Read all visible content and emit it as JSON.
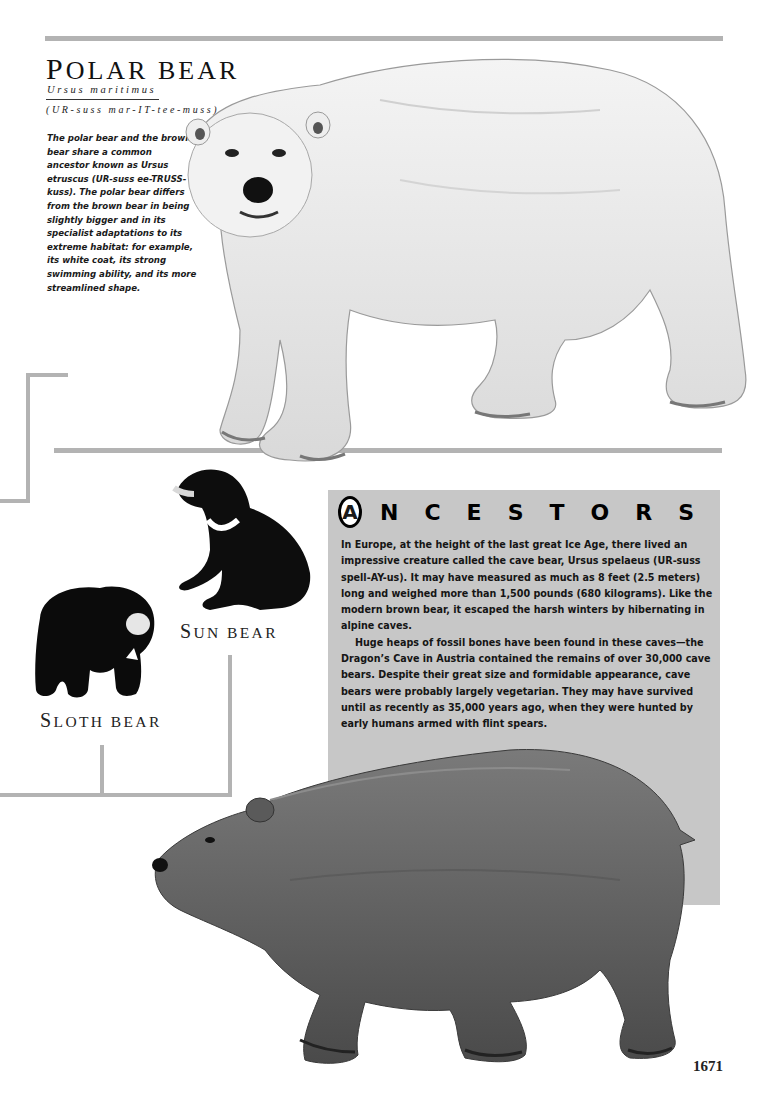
{
  "page": {
    "number": "1671",
    "colors": {
      "rule": "#b3b3b3",
      "ancestors_bg": "#c7c7c7",
      "text": "#1a1a1a"
    }
  },
  "polar_bear": {
    "title_cap": "P",
    "title_rest": "OLAR BEAR",
    "latin_name": "Ursus maritimus",
    "pronunciation": "(UR-suss mar-IT-tee-muss)",
    "intro": "The polar bear and the brown bear share a common ancestor known as Ursus etruscus (UR-suss ee-TRUSS-kuss). The polar bear differs from the brown bear in being slightly bigger and in its specialist adaptations to its extreme habitat: for example, its white coat, its strong swimming ability, and its more streamlined shape.",
    "illustration": "polar-bear-illustration"
  },
  "relatives": {
    "sun_bear": {
      "cap": "S",
      "rest": "UN BEAR",
      "illustration": "sun-bear-illustration"
    },
    "sloth_bear": {
      "cap": "S",
      "rest": "LOTH BEAR",
      "illustration": "sloth-bear-illustration"
    }
  },
  "ancestors": {
    "initial": "A",
    "heading_rest": "NCESTORS",
    "paragraphs": [
      "In Europe, at the height of the last great Ice Age, there lived an impressive creature called the cave bear, Ursus spelaeus (UR-suss spell-AY-us). It may have measured as much as 8 feet (2.5 meters) long and weighed more than 1,500 pounds (680 kilograms). Like the modern brown bear, it escaped the harsh winters by hibernating in alpine caves.",
      "Huge heaps of fossil bones have been found in these caves—the Dragon’s Cave in Austria contained the remains of over 30,000 cave bears. Despite their great size and formidable appearance, cave bears were probably largely vegetarian. They may have survived until as recently as 35,000 years ago, when they were hunted by early humans armed with flint spears."
    ],
    "illustration": "cave-bear-illustration"
  }
}
